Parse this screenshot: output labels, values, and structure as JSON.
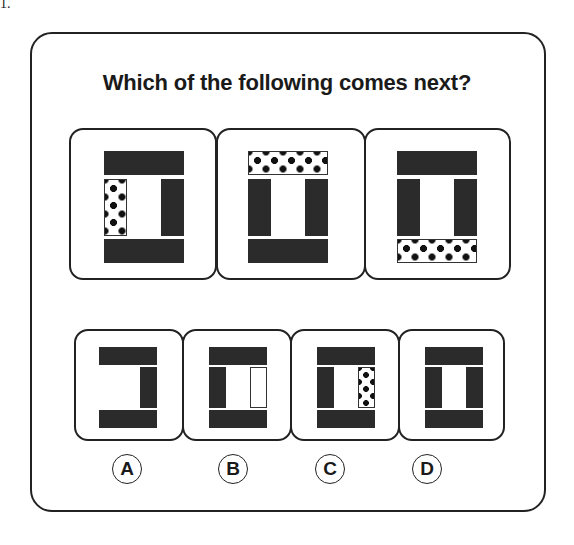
{
  "question_number": "1.",
  "title": "Which of the following comes next?",
  "sequence": [
    {
      "id": "seq-1",
      "description": "top bar dark, left bar dotted, right bar dark, bottom bar dark"
    },
    {
      "id": "seq-2",
      "description": "top bar dotted, left bar dark, right bar dark, bottom bar dark"
    },
    {
      "id": "seq-3",
      "description": "top bar dark, left bar dark, right bar dark, bottom bar dotted"
    }
  ],
  "options": [
    {
      "letter": "A",
      "description": "top dark, right dark, bottom dark, left missing"
    },
    {
      "letter": "B",
      "description": "top dark, left dark, right outlined white, bottom dark"
    },
    {
      "letter": "C",
      "description": "top dark, left dark, right dotted, bottom dark"
    },
    {
      "letter": "D",
      "description": "top dark, left dark, right dark, bottom dark"
    }
  ],
  "colors": {
    "stroke": "#222222",
    "fill_dark": "#2b2b2b",
    "background": "#ffffff"
  }
}
